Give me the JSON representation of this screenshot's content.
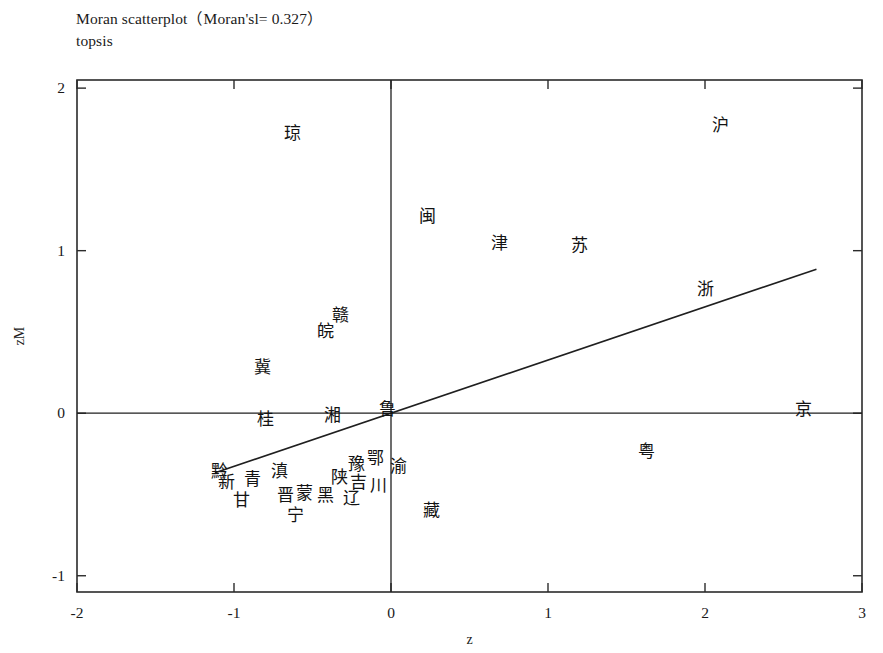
{
  "title": {
    "line1": "Moran scatterplot（Moran'sl= 0.327）",
    "line2": "topsis"
  },
  "chart_data": {
    "type": "scatter",
    "title": "Moran scatterplot（Moran'sl= 0.327）",
    "subtitle": "topsis",
    "xlabel": "z",
    "ylabel": "zM",
    "xlim": [
      -2,
      3
    ],
    "ylim": [
      -1.1,
      2.05
    ],
    "xticks": [
      -2,
      -1,
      0,
      1,
      2,
      3
    ],
    "xtick_labels": [
      "-2",
      "-1",
      "0",
      "1",
      "2",
      "3"
    ],
    "yticks": [
      -1,
      0,
      1,
      2
    ],
    "ytick_labels": [
      "-1",
      "0",
      "1",
      "2"
    ],
    "grid": false,
    "legend": false,
    "morans_i": 0.327,
    "reference_lines": {
      "vertical_x": 0,
      "horizontal_y": 0
    },
    "fit_line": {
      "slope": 0.327,
      "intercept": 0.0,
      "x_start": -1.12,
      "x_end": 2.71
    },
    "point_label_type": "chinese-province-abbreviation",
    "points": [
      {
        "label": "琼",
        "x": -0.63,
        "y": 1.72
      },
      {
        "label": "沪",
        "x": 2.1,
        "y": 1.77
      },
      {
        "label": "闽",
        "x": 0.23,
        "y": 1.21
      },
      {
        "label": "津",
        "x": 0.69,
        "y": 1.04
      },
      {
        "label": "苏",
        "x": 1.2,
        "y": 1.03
      },
      {
        "label": "浙",
        "x": 2.0,
        "y": 0.76
      },
      {
        "label": "赣",
        "x": -0.32,
        "y": 0.6
      },
      {
        "label": "皖",
        "x": -0.42,
        "y": 0.5
      },
      {
        "label": "冀",
        "x": -0.82,
        "y": 0.28
      },
      {
        "label": "桂",
        "x": -0.8,
        "y": -0.04
      },
      {
        "label": "湘",
        "x": -0.37,
        "y": -0.02
      },
      {
        "label": "鲁",
        "x": -0.02,
        "y": 0.02
      },
      {
        "label": "京",
        "x": 2.63,
        "y": 0.02
      },
      {
        "label": "粤",
        "x": 1.63,
        "y": -0.24
      },
      {
        "label": "鄂",
        "x": -0.1,
        "y": -0.28
      },
      {
        "label": "豫",
        "x": -0.22,
        "y": -0.32
      },
      {
        "label": "渝",
        "x": 0.05,
        "y": -0.33
      },
      {
        "label": "黔",
        "x": -1.09,
        "y": -0.36
      },
      {
        "label": "滇",
        "x": -0.71,
        "y": -0.36
      },
      {
        "label": "青",
        "x": -0.88,
        "y": -0.41
      },
      {
        "label": "陕",
        "x": -0.33,
        "y": -0.4
      },
      {
        "label": "吉",
        "x": -0.21,
        "y": -0.43
      },
      {
        "label": "新",
        "x": -1.05,
        "y": -0.43
      },
      {
        "label": "川",
        "x": -0.08,
        "y": -0.45
      },
      {
        "label": "蒙",
        "x": -0.55,
        "y": -0.5
      },
      {
        "label": "晋",
        "x": -0.67,
        "y": -0.51
      },
      {
        "label": "黑",
        "x": -0.42,
        "y": -0.51
      },
      {
        "label": "辽",
        "x": -0.25,
        "y": -0.53
      },
      {
        "label": "甘",
        "x": -0.95,
        "y": -0.54
      },
      {
        "label": "藏",
        "x": 0.26,
        "y": -0.6
      },
      {
        "label": "宁",
        "x": -0.61,
        "y": -0.63
      }
    ]
  }
}
